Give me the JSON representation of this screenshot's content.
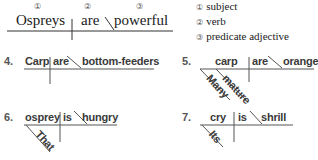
{
  "example": {
    "markers": [
      "①",
      "②",
      "③"
    ],
    "subject": "Ospreys",
    "verb": "are",
    "complement": "powerful"
  },
  "legend": [
    {
      "marker": "①",
      "label": "subject"
    },
    {
      "marker": "②",
      "label": "verb"
    },
    {
      "marker": "③",
      "label": "predicate adjective"
    }
  ],
  "exercises": [
    {
      "number": "4.",
      "subject": "Carp",
      "verb": "are",
      "complement": "bottom-feeders",
      "modifiers": []
    },
    {
      "number": "5.",
      "subject": "carp",
      "verb": "are",
      "complement": "orange",
      "modifiers": [
        "Many",
        "mature"
      ]
    },
    {
      "number": "6.",
      "subject": "osprey",
      "verb": "is",
      "complement": "hungry",
      "modifiers": [
        "That"
      ]
    },
    {
      "number": "7.",
      "subject": "cry",
      "verb": "is",
      "complement": "shrill",
      "modifiers": [
        "Its"
      ]
    }
  ],
  "colors": {
    "line": "#444444",
    "text": "#1a1a1a",
    "sans_text": "#3a3a3a"
  }
}
